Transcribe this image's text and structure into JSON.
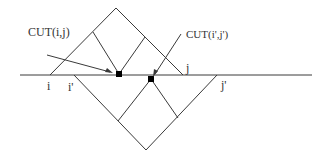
{
  "diagram": {
    "type": "geometric-cut-diagram",
    "labels": {
      "cut_ij": "CUT(i,j)",
      "cut_i2j2": "CUT(i',j')",
      "i": "i",
      "j": "j",
      "i_prime": "i'",
      "j_prime": "j'"
    },
    "colors": {
      "line": "#3a3a3a",
      "dot": "#000000",
      "text": "#333333",
      "background": "#ffffff"
    }
  }
}
